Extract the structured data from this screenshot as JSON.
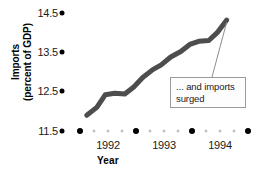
{
  "chart_data": {
    "type": "line",
    "title": "",
    "xlabel": "Year",
    "ylabel": "Imports (percent of GDP)",
    "ylabel_line1": "Imports",
    "ylabel_line2": "(percent of GDP)",
    "ylim": [
      11.5,
      14.5
    ],
    "yticks": [
      14.5,
      13.5,
      12.5,
      11.5
    ],
    "ytick_labels": [
      "14.5",
      "13.5",
      "12.5",
      "11.5"
    ],
    "xlim": [
      1991.0,
      1994.75
    ],
    "xticks": [
      1992,
      1993,
      1994
    ],
    "xtick_labels": [
      "1992",
      "1993",
      "1994"
    ],
    "grid": false,
    "legend": false,
    "series": [
      {
        "name": "Imports (percent of GDP)",
        "color": "#4d4d4d",
        "x": [
          1991.62,
          1991.8,
          1991.95,
          1992.12,
          1992.3,
          1992.46,
          1992.62,
          1992.8,
          1992.95,
          1993.12,
          1993.3,
          1993.46,
          1993.62,
          1993.8,
          1993.95,
          1994.12
        ],
        "values": [
          11.9,
          12.1,
          12.42,
          12.46,
          12.44,
          12.62,
          12.86,
          13.06,
          13.18,
          13.38,
          13.52,
          13.7,
          13.78,
          13.8,
          14.0,
          14.32
        ]
      }
    ],
    "annotations": [
      {
        "text": "... and imports surged",
        "text_line1": "... and imports",
        "text_line2": "surged",
        "points_to_x": 1994.12,
        "points_to_y": 14.32
      }
    ]
  },
  "axis": {
    "x_dot_rail_major_count": 5,
    "x_dot_rail_minor_per_gap": 3
  }
}
